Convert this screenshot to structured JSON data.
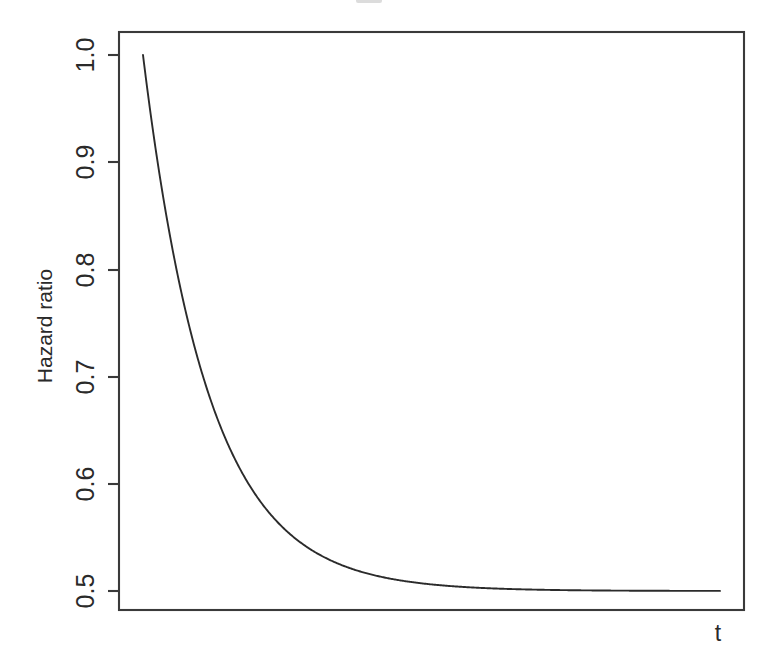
{
  "figure": {
    "width": 772,
    "height": 657,
    "background": "#ffffff",
    "line_color": "#2b2b2b",
    "axis_color": "#3a3a3a"
  },
  "axes": {
    "y_title": "Hazard ratio",
    "x_title": "t",
    "y_tick_labels": [
      "0.5",
      "0.6",
      "0.7",
      "0.8",
      "0.9",
      "1.0"
    ],
    "x_tick_labels": []
  },
  "chart_data": {
    "type": "line",
    "title": "",
    "subtitle": "",
    "xlabel": "t",
    "ylabel": "Hazard ratio",
    "xlim": [
      0,
      40
    ],
    "ylim": [
      0.47,
      1.02
    ],
    "grid": false,
    "legend": "none",
    "annotations": [],
    "formula": "HR(t) = 0.5 + 0.5 * exp(-0.22 * t)",
    "asymptote": 0.5,
    "y_ticks": [
      0.5,
      0.6,
      0.7,
      0.8,
      0.9,
      1.0
    ],
    "series": [
      {
        "name": "Hazard ratio",
        "color": "#2b2b2b",
        "x": [
          0,
          0.4,
          0.8,
          1.2,
          1.6,
          2,
          2.4,
          2.8,
          3.2,
          3.6,
          4,
          4.5,
          5,
          5.5,
          6,
          6.5,
          7,
          7.5,
          8,
          9,
          10,
          11,
          12,
          13,
          14,
          15,
          16,
          18,
          20,
          22,
          24,
          26,
          28,
          30,
          32,
          34,
          36,
          38,
          40
        ],
        "y": [
          1.0,
          0.958,
          0.919,
          0.884,
          0.852,
          0.822,
          0.795,
          0.771,
          0.748,
          0.727,
          0.708,
          0.686,
          0.667,
          0.65,
          0.634,
          0.62,
          0.607,
          0.596,
          0.586,
          0.569,
          0.555,
          0.545,
          0.536,
          0.529,
          0.523,
          0.519,
          0.515,
          0.509,
          0.506,
          0.504,
          0.503,
          0.502,
          0.501,
          0.501,
          0.5,
          0.5,
          0.5,
          0.5,
          0.5
        ]
      }
    ]
  }
}
